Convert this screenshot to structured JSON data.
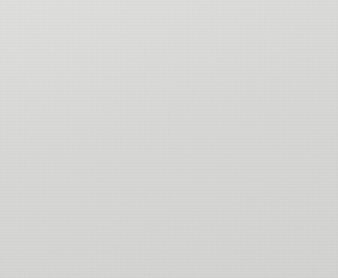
{
  "title": {
    "line1": "Rate of violent victimization per",
    "line2": "1,000 persons age 12 or older"
  },
  "chart_data": {
    "type": "line",
    "title": "Rate of violent victimization per 1,000 persons age 12 or older",
    "xlabel": "",
    "ylabel": "",
    "x": [
      1993,
      1994,
      1995,
      1996,
      1997,
      1998,
      1999,
      2000
    ],
    "categories": [
      "1993",
      "1994",
      "1995",
      "1996",
      "1997",
      "1998",
      "1999",
      "2000"
    ],
    "tick_labels_shown": [
      "1993",
      "1995",
      "1997",
      "1999"
    ],
    "ylim": [
      0,
      70
    ],
    "yticks": [
      0,
      10,
      20,
      30,
      40,
      50,
      60,
      70
    ],
    "grid": true,
    "legend": "inline-labels",
    "series": [
      {
        "name": "Black",
        "style": "solid-thick-black",
        "color": "#111111",
        "values": [
          67.5,
          61,
          61,
          52,
          49,
          41,
          41,
          34
        ]
      },
      {
        "name": "White",
        "style": "solid-medium-gray",
        "color": "#6b6b6b",
        "values": [
          49,
          50.5,
          47,
          43,
          38.5,
          36,
          31,
          26
        ]
      },
      {
        "name": "Other",
        "style": "dashed-black",
        "color": "#111111",
        "values": [
          39.5,
          50,
          42,
          30,
          28,
          27.5,
          25,
          20.5
        ]
      }
    ]
  },
  "axis": {
    "y_tick_labels": [
      "70",
      "60",
      "50",
      "40",
      "30",
      "20",
      "10",
      "0"
    ],
    "x_tick_labels": [
      "1993",
      "1995",
      "1997",
      "1999"
    ]
  },
  "series_labels": {
    "black": "Black",
    "white": "White",
    "other": "Other"
  },
  "colors": {
    "background": "#d9d9d7",
    "black_series": "#111111",
    "white_series": "#6b6b6b",
    "other_series": "#111111",
    "grid": "#1a1a1a"
  }
}
